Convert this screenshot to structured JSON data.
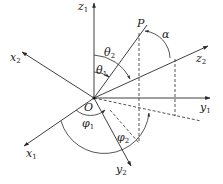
{
  "diagram": {
    "type": "3d-coordinate-rotation-diagram",
    "origin": {
      "label": "O",
      "x": 94,
      "y": 98
    },
    "axes": [
      {
        "id": "z1",
        "name": "z",
        "sub": "1",
        "x2": 94,
        "y2": 3
      },
      {
        "id": "x2",
        "name": "x",
        "sub": "2",
        "x2": 22,
        "y2": 52
      },
      {
        "id": "y1",
        "name": "y",
        "sub": "1",
        "x2": 210,
        "y2": 98
      },
      {
        "id": "x1",
        "name": "x",
        "sub": "1",
        "x2": 24,
        "y2": 146
      },
      {
        "id": "y2",
        "name": "y",
        "sub": "2",
        "x2": 131,
        "y2": 166
      },
      {
        "id": "z2",
        "name": "z",
        "sub": "2",
        "x2": 208,
        "y2": 46
      }
    ],
    "point": {
      "label": "P",
      "x": 143,
      "y": 30
    },
    "angles": [
      {
        "id": "theta1",
        "name": "θ",
        "sub": "1"
      },
      {
        "id": "theta2",
        "name": "θ",
        "sub": "2"
      },
      {
        "id": "phi1",
        "name": "φ",
        "sub": "1"
      },
      {
        "id": "phi2",
        "name": "φ",
        "sub": "2"
      },
      {
        "id": "alpha",
        "name": "α",
        "sub": ""
      }
    ],
    "colors": {
      "line": "#2a2a2a",
      "background": "#ffffff"
    }
  }
}
